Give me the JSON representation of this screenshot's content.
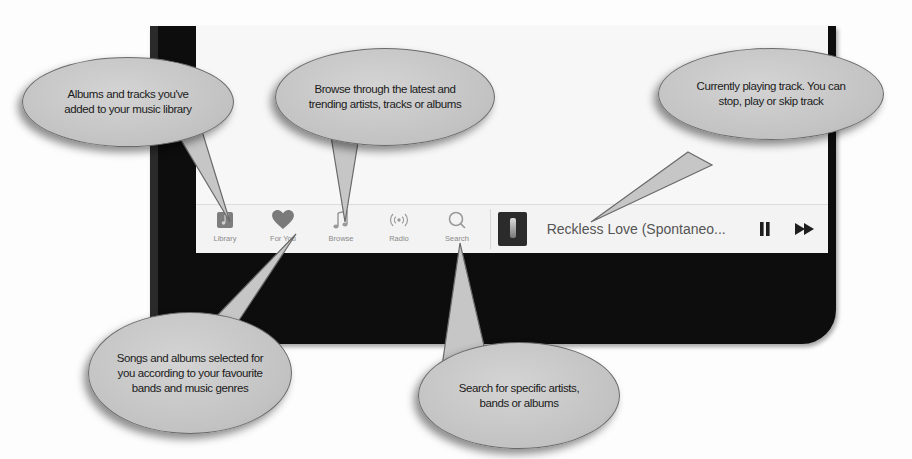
{
  "tabbar": {
    "tabs": [
      {
        "label": "Library",
        "icon": "library-icon"
      },
      {
        "label": "For You",
        "icon": "heart-icon"
      },
      {
        "label": "Browse",
        "icon": "music-note-icon"
      },
      {
        "label": "Radio",
        "icon": "radio-broadcast-icon"
      },
      {
        "label": "Search",
        "icon": "search-icon"
      }
    ]
  },
  "now_playing": {
    "track_title": "Reckless Love (Spontaneo...",
    "controls": [
      {
        "name": "pause",
        "icon": "pause-icon"
      },
      {
        "name": "skip",
        "icon": "fast-forward-icon"
      }
    ]
  },
  "callouts": {
    "library": "Albums and tracks you've added to your music library",
    "browse": "Browse through the latest and trending artists, tracks or albums",
    "now_playing": "Currently playing track. You can stop, play or skip track",
    "for_you": "Songs and albums selected for you according to your favourite bands and music genres",
    "search": "Search for specific artists, bands or albums"
  },
  "colors": {
    "bezel": "#0d0d0d",
    "screen": "#f6f6f6",
    "bubble": "#c6c6c6",
    "tab_icon": "#8a8a8a",
    "heart": "#7a7a7a"
  }
}
